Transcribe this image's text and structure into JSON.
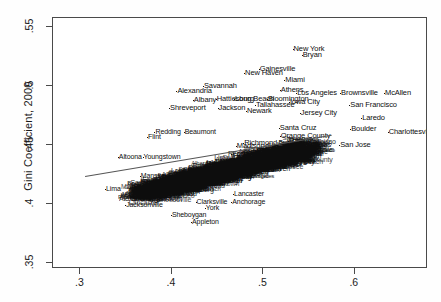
{
  "chart_data": {
    "type": "scatter",
    "title": "",
    "xlabel": "",
    "ylabel": "Gini Coefficient, 2000",
    "xlim": [
      0.27,
      0.68
    ],
    "ylim": [
      0.345,
      0.558
    ],
    "xticks": [
      ".3",
      ".4",
      ".5",
      ".6"
    ],
    "xtick_values": [
      0.3,
      0.4,
      0.5,
      0.6
    ],
    "yticks": [
      ".35",
      ".4",
      ".45",
      ".5",
      ".55"
    ],
    "ytick_values": [
      0.35,
      0.4,
      0.45,
      0.5,
      0.55
    ],
    "grid": false,
    "legend": "none",
    "marker_style": "text-label",
    "fit_line": {
      "x0": 0.305,
      "y0": 0.424,
      "x1": 0.575,
      "y1": 0.459
    },
    "note": "Each observation is plotted as the metro area name; heavy overplotting in the center.",
    "points": [
      {
        "label": "New York",
        "x": 0.533,
        "y": 0.532
      },
      {
        "label": "Bryan",
        "x": 0.543,
        "y": 0.527
      },
      {
        "label": "Gainesville",
        "x": 0.496,
        "y": 0.515
      },
      {
        "label": "New Haven",
        "x": 0.48,
        "y": 0.511
      },
      {
        "label": "Miami",
        "x": 0.524,
        "y": 0.505
      },
      {
        "label": "Athens",
        "x": 0.519,
        "y": 0.497
      },
      {
        "label": "Los Angeles",
        "x": 0.537,
        "y": 0.494
      },
      {
        "label": "Brownsville",
        "x": 0.585,
        "y": 0.494
      },
      {
        "label": "McAllen",
        "x": 0.633,
        "y": 0.494
      },
      {
        "label": "Savannah",
        "x": 0.435,
        "y": 0.5
      },
      {
        "label": "Alexandria",
        "x": 0.406,
        "y": 0.496
      },
      {
        "label": "Bloomington",
        "x": 0.505,
        "y": 0.489
      },
      {
        "label": "Long Beach",
        "x": 0.469,
        "y": 0.489
      },
      {
        "label": "Albany",
        "x": 0.424,
        "y": 0.488
      },
      {
        "label": "Hattiesburg",
        "x": 0.449,
        "y": 0.489
      },
      {
        "label": "Tallahassee",
        "x": 0.492,
        "y": 0.484
      },
      {
        "label": "Iowa City",
        "x": 0.529,
        "y": 0.487
      },
      {
        "label": "San Francisco",
        "x": 0.595,
        "y": 0.484
      },
      {
        "label": "Shreveport",
        "x": 0.398,
        "y": 0.482
      },
      {
        "label": "Jackson",
        "x": 0.451,
        "y": 0.482
      },
      {
        "label": "Newark",
        "x": 0.482,
        "y": 0.479
      },
      {
        "label": "Jersey City",
        "x": 0.541,
        "y": 0.477
      },
      {
        "label": "Laredo",
        "x": 0.608,
        "y": 0.473
      },
      {
        "label": "Santa Cruz",
        "x": 0.518,
        "y": 0.465
      },
      {
        "label": "Boulder",
        "x": 0.596,
        "y": 0.464
      },
      {
        "label": "Charlottesville",
        "x": 0.637,
        "y": 0.461
      },
      {
        "label": "Orange County",
        "x": 0.519,
        "y": 0.458
      },
      {
        "label": "Raleigh",
        "x": 0.528,
        "y": 0.454
      },
      {
        "label": "Salinas",
        "x": 0.548,
        "y": 0.45
      },
      {
        "label": "San Jose",
        "x": 0.584,
        "y": 0.45
      },
      {
        "label": "Richmond",
        "x": 0.479,
        "y": 0.452
      },
      {
        "label": "Madison",
        "x": 0.471,
        "y": 0.449
      },
      {
        "label": "Middlesex",
        "x": 0.498,
        "y": 0.445
      },
      {
        "label": "Fort Collins",
        "x": 0.466,
        "y": 0.443
      },
      {
        "label": "Redding",
        "x": 0.382,
        "y": 0.461
      },
      {
        "label": "Beaumont",
        "x": 0.414,
        "y": 0.461
      },
      {
        "label": "Flint",
        "x": 0.374,
        "y": 0.457
      },
      {
        "label": "Altoona",
        "x": 0.342,
        "y": 0.44
      },
      {
        "label": "Youngstown",
        "x": 0.369,
        "y": 0.44
      },
      {
        "label": "Mansfield",
        "x": 0.366,
        "y": 0.424
      },
      {
        "label": "Lima",
        "x": 0.328,
        "y": 0.413
      },
      {
        "label": "Wausau",
        "x": 0.4,
        "y": 0.409
      },
      {
        "label": "Kokomo",
        "x": 0.488,
        "y": 0.442
      },
      {
        "label": "Lancaster",
        "x": 0.468,
        "y": 0.409
      },
      {
        "label": "Clarksville",
        "x": 0.427,
        "y": 0.402
      },
      {
        "label": "Anchorage",
        "x": 0.466,
        "y": 0.402
      },
      {
        "label": "Jacksonville",
        "x": 0.35,
        "y": 0.399
      },
      {
        "label": "York",
        "x": 0.437,
        "y": 0.397
      },
      {
        "label": "Sheboygan",
        "x": 0.4,
        "y": 0.391
      },
      {
        "label": "Appleton",
        "x": 0.422,
        "y": 0.385
      }
    ]
  }
}
